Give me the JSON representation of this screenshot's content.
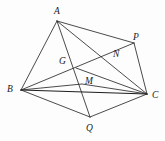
{
  "figure": {
    "background_color": "#fdfdfd",
    "line_color": "#2a2a2a",
    "label_color": "#1a1a1a",
    "width": 165,
    "height": 141,
    "points": [
      {
        "id": "A",
        "label": "A",
        "x": 57,
        "y": 21,
        "label_x": 54,
        "label_y": 7
      },
      {
        "id": "B",
        "label": "B",
        "x": 21,
        "y": 90,
        "label_x": 7,
        "label_y": 85
      },
      {
        "id": "C",
        "label": "C",
        "x": 147,
        "y": 94,
        "label_x": 152,
        "label_y": 91
      },
      {
        "id": "P",
        "label": "P",
        "x": 134,
        "y": 43,
        "label_x": 133,
        "label_y": 33
      },
      {
        "id": "Q",
        "label": "Q",
        "x": 90,
        "y": 117,
        "label_x": 86,
        "label_y": 124
      },
      {
        "id": "G",
        "label": "G",
        "x": 76,
        "y": 68,
        "label_x": 59,
        "label_y": 57
      },
      {
        "id": "M",
        "label": "M",
        "x": 82,
        "y": 84,
        "label_x": 85,
        "label_y": 77
      },
      {
        "id": "N",
        "label": "N",
        "x": 111,
        "y": 59,
        "label_x": 113,
        "label_y": 50
      }
    ],
    "segments": [
      {
        "id": "AB",
        "from": "A",
        "to": "B",
        "weight": "normal"
      },
      {
        "id": "AC",
        "from": "A",
        "to": "C",
        "weight": "normal"
      },
      {
        "id": "AP",
        "from": "A",
        "to": "P",
        "weight": "normal"
      },
      {
        "id": "AQ",
        "from": "A",
        "to": "Q",
        "weight": "normal"
      },
      {
        "id": "BC",
        "from": "B",
        "to": "C",
        "weight": "strong"
      },
      {
        "id": "BP",
        "from": "B",
        "to": "P",
        "weight": "normal"
      },
      {
        "id": "BQ",
        "from": "B",
        "to": "Q",
        "weight": "normal"
      },
      {
        "id": "PC",
        "from": "P",
        "to": "C",
        "weight": "normal"
      },
      {
        "id": "QC",
        "from": "Q",
        "to": "C",
        "weight": "normal"
      },
      {
        "id": "GC",
        "from": "G",
        "to": "C",
        "weight": "normal"
      },
      {
        "id": "BMC",
        "from": "B",
        "to": "C",
        "weight": "normal",
        "via": "M"
      }
    ]
  }
}
